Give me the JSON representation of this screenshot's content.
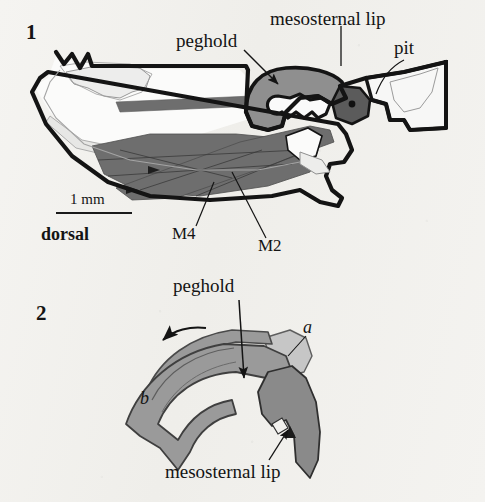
{
  "figure": {
    "type": "scientific-line-drawing",
    "background_color": "#f3f2ef",
    "ink_color": "#141414",
    "panels": [
      {
        "number": "1",
        "description": "sagittal section of thorax showing peghold, mesosternal lip, pit and muscles",
        "labels": [
          "peghold",
          "mesosternal lip",
          "pit",
          "M4",
          "M2"
        ],
        "scale_bar": {
          "text": "1 mm"
        },
        "orientation": "dorsal"
      },
      {
        "number": "2",
        "description": "detail of peghold and mesosternal lip interlock with rotation arrow",
        "labels": [
          "peghold",
          "mesosternal lip",
          "a",
          "b"
        ]
      }
    ]
  },
  "panel1": {
    "number": "1",
    "peghold": "peghold",
    "mesosternal_lip": "mesosternal lip",
    "pit": "pit",
    "m4": "M4",
    "m2": "M2",
    "scale_text": "1 mm",
    "dorsal": "dorsal"
  },
  "panel2": {
    "number": "2",
    "peghold": "peghold",
    "mesosternal_lip": "mesosternal lip",
    "part_a": "a",
    "part_b": "b"
  },
  "colors": {
    "outline": "#141414",
    "muscle_dark_gray": "#6e6e6e",
    "shade_mid_gray": "#8f8f8f",
    "shade_light_gray": "#b4b4b4",
    "shade_pale_gray": "#cfcfcf",
    "paper": "#f3f2ef"
  }
}
